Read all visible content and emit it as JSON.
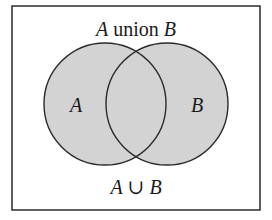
{
  "title": {
    "set_a": "A",
    "word": "union",
    "set_b": "B"
  },
  "circles": {
    "left_label": "A",
    "right_label": "B"
  },
  "caption": {
    "set_a": "A",
    "symbol": "∪",
    "set_b": "B"
  },
  "colors": {
    "fill": "#d3d3d3",
    "stroke": "#2a2a2a",
    "border": "#2a2a2a",
    "background": "#ffffff"
  }
}
